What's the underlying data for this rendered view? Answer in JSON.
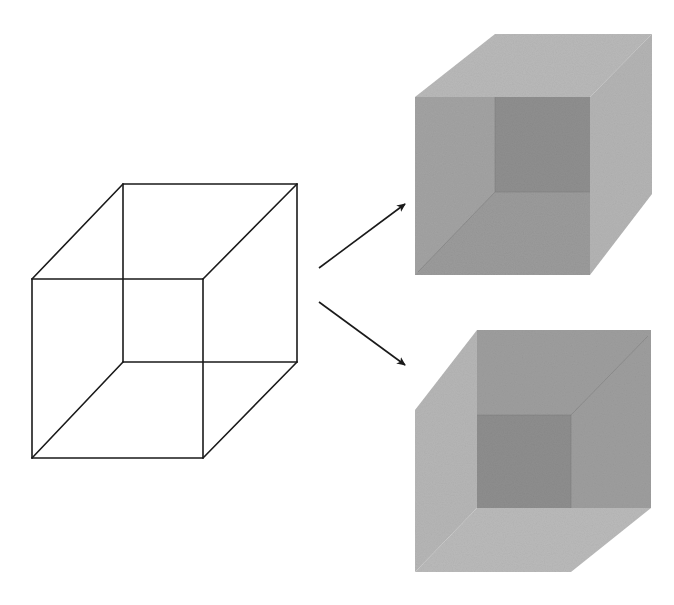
{
  "diagram": {
    "wireframe": {
      "label": "Ambiguous wireframe cube",
      "stroke": "#1a1a1a",
      "stroke_width": 1.6,
      "edges": [
        [
          123,
          184,
          297,
          184
        ],
        [
          297,
          184,
          297,
          362
        ],
        [
          297,
          362,
          123,
          362
        ],
        [
          123,
          362,
          123,
          184
        ],
        [
          32,
          279,
          203,
          279
        ],
        [
          203,
          279,
          203,
          458
        ],
        [
          203,
          458,
          32,
          458
        ],
        [
          32,
          458,
          32,
          279
        ],
        [
          32,
          279,
          123,
          184
        ],
        [
          203,
          279,
          297,
          184
        ],
        [
          32,
          458,
          123,
          362
        ],
        [
          203,
          458,
          297,
          362
        ]
      ]
    },
    "arrows": [
      {
        "name": "arrow-to-top-interpretation",
        "x1": 319,
        "y1": 268,
        "x2": 405,
        "y2": 204
      },
      {
        "name": "arrow-to-bottom-interpretation",
        "x1": 319,
        "y1": 302,
        "x2": 405,
        "y2": 365
      }
    ],
    "arrow_color": "#1a1a1a",
    "interpretations": [
      {
        "name": "cube-viewed-from-above",
        "label": "Interpretation 1: viewed from above (front face lower-left)",
        "faces": [
          {
            "name": "top-face",
            "points": "415,97 495,34 652,34 590,97",
            "fill": "#b9b9b9"
          },
          {
            "name": "right-face",
            "points": "590,97 652,34 652,194 590,275",
            "fill": "#b4b4b4"
          },
          {
            "name": "front-face",
            "points": "415,97 590,97 590,275 415,275",
            "fill": "#a3a3a3"
          },
          {
            "name": "inner-back-square",
            "points": "495,97 590,97 590,192 495,192",
            "fill": "#8f8f8f"
          },
          {
            "name": "inner-floor",
            "points": "415,275 495,192 590,192 590,275",
            "fill": "#9b9b9b"
          }
        ],
        "inner_edges": [
          [
            495,
            192,
            590,
            192
          ],
          [
            495,
            97,
            495,
            192
          ],
          [
            495,
            192,
            418,
            272
          ]
        ]
      },
      {
        "name": "cube-viewed-from-below",
        "label": "Interpretation 2: viewed from below (front face upper-right)",
        "faces": [
          {
            "name": "left-face",
            "points": "415,410 477,330 477,508 415,572",
            "fill": "#b6b6b6"
          },
          {
            "name": "bottom-face",
            "points": "415,572 477,508 651,508 571,572",
            "fill": "#bababa"
          },
          {
            "name": "front-face",
            "points": "477,330 651,330 651,508 477,508",
            "fill": "#9e9e9e"
          },
          {
            "name": "inner-back-square",
            "points": "477,415 571,415 571,508 477,508",
            "fill": "#8e8e8e"
          }
        ],
        "inner_edges": [
          [
            477,
            415,
            571,
            415
          ],
          [
            571,
            415,
            571,
            508
          ],
          [
            571,
            415,
            648,
            336
          ]
        ]
      }
    ]
  }
}
